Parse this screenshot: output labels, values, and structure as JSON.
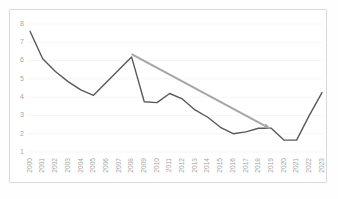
{
  "chart_data": {
    "type": "line",
    "title": "",
    "subtitle": "",
    "xlabel": "",
    "ylabel": "",
    "grid": true,
    "legend": "none",
    "categories": [
      "2000",
      "2001",
      "2002",
      "2003",
      "2004",
      "2005",
      "2006",
      "2007",
      "2008",
      "2009",
      "2010",
      "2011",
      "2012",
      "2013",
      "2014",
      "2015",
      "2016",
      "2017",
      "2018",
      "2019",
      "2020",
      "2021",
      "2022",
      "2023"
    ],
    "values": [
      7.6,
      6.1,
      5.4,
      4.85,
      4.4,
      4.1,
      4.8,
      5.5,
      6.2,
      3.75,
      3.7,
      4.2,
      3.9,
      3.3,
      2.9,
      2.35,
      2.0,
      2.1,
      2.3,
      2.3,
      1.65,
      1.65,
      3.0,
      4.25
    ],
    "series": [
      {
        "name": "value",
        "values": [
          7.6,
          6.1,
          5.4,
          4.85,
          4.4,
          4.1,
          4.8,
          5.5,
          6.2,
          3.75,
          3.7,
          4.2,
          3.9,
          3.3,
          2.9,
          2.35,
          2.0,
          2.1,
          2.3,
          2.3,
          1.65,
          1.65,
          3.0,
          4.25
        ],
        "color": "#595959"
      }
    ],
    "ylim": [
      1,
      8
    ],
    "yticks": [
      1,
      2,
      3,
      4,
      5,
      6,
      7,
      8
    ],
    "ytick_labels": [
      "1",
      "2",
      "3",
      "4",
      "5",
      "6",
      "7",
      "8"
    ],
    "xlim": [
      "2000",
      "2023"
    ],
    "annotations": [
      {
        "type": "arrow",
        "name": "downward-trend-arrow",
        "from_x": "2008",
        "from_y": 6.35,
        "to_x": "2019",
        "to_y": 2.25,
        "color": "#a6a6a6"
      }
    ]
  },
  "style": {
    "line_color": "#595959",
    "arrow_color": "#a6a6a6",
    "grid_color": "#f2f2f2",
    "axis_label_color": "#a6a6a6",
    "border_color": "#d9d9d9",
    "plot_background": "#ffffff"
  }
}
